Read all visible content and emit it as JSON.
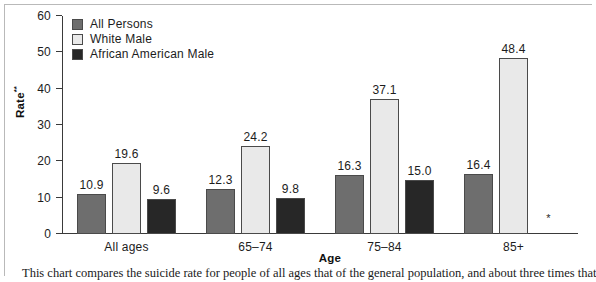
{
  "figure": {
    "frame_color": "#b9b9b9",
    "background": "#ffffff"
  },
  "legend": {
    "position": "top-left-inside",
    "items": [
      {
        "label": "All Persons",
        "color": "#6e6e6e"
      },
      {
        "label": "White Male",
        "color": "#e9e9e9"
      },
      {
        "label": "African American Male",
        "color": "#272727"
      }
    ]
  },
  "axes": {
    "ylabel": "Rate",
    "ylabel_superscript": "**",
    "xlabel": "Age",
    "yticks": [
      0,
      10,
      20,
      30,
      40,
      50,
      60
    ]
  },
  "suppressed_marker": "*",
  "caption": {
    "left": "This chart compares the suicide rate for people of all ages",
    "right": "that of the general population, and about three times that of"
  },
  "chart_data": {
    "type": "bar",
    "title": "",
    "xlabel": "Age",
    "ylabel": "Rate**",
    "ylim": [
      0,
      60
    ],
    "yticks": [
      0,
      10,
      20,
      30,
      40,
      50,
      60
    ],
    "grid": false,
    "legend_position": "upper left",
    "categories": [
      "All ages",
      "65–74",
      "75–84",
      "85+"
    ],
    "series": [
      {
        "name": "All Persons",
        "color": "#6e6e6e",
        "values": [
          10.9,
          12.3,
          16.3,
          16.4
        ],
        "labels": [
          "10.9",
          "12.3",
          "16.3",
          "16.4"
        ]
      },
      {
        "name": "White Male",
        "color": "#e9e9e9",
        "values": [
          19.6,
          24.2,
          37.1,
          48.4
        ],
        "labels": [
          "19.6",
          "24.2",
          "37.1",
          "48.4"
        ]
      },
      {
        "name": "African American Male",
        "color": "#272727",
        "values": [
          9.6,
          9.8,
          15.0,
          null
        ],
        "labels": [
          "9.6",
          "9.8",
          "15.0",
          "*"
        ]
      }
    ]
  }
}
